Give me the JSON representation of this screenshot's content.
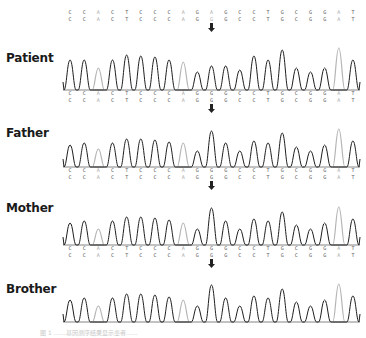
{
  "reference": {
    "row1": [
      "C",
      "C",
      "A",
      "C",
      "T",
      "C",
      "C",
      "C",
      "A",
      "G",
      "A",
      "G",
      "C",
      "C",
      "T",
      "G",
      "C",
      "G",
      "G",
      "A",
      "T"
    ],
    "row2": [
      "C",
      "C",
      "A",
      "C",
      "T",
      "C",
      "C",
      "C",
      "A",
      "G",
      "G",
      "G",
      "C",
      "C",
      "T",
      "G",
      "C",
      "G",
      "G",
      "A",
      "T"
    ],
    "grey_positions": [
      2,
      8,
      10,
      19
    ]
  },
  "mutation_arrow": {
    "icon": "down-arrow-icon",
    "position_index": 10
  },
  "panels": [
    {
      "label": "Patient",
      "heights": [
        30,
        30,
        22,
        30,
        35,
        34,
        33,
        30,
        28,
        18,
        24,
        24,
        20,
        34,
        30,
        40,
        22,
        18,
        22,
        42,
        30
      ],
      "grey_peaks": [
        2,
        8,
        19
      ],
      "seq_row1": [
        "C",
        "C",
        "A",
        "C",
        "T",
        "C",
        "C",
        "C",
        "A",
        "G",
        "G",
        "G",
        "C",
        "C",
        "T",
        "G",
        "C",
        "G",
        "G",
        "A",
        "T"
      ],
      "seq_row2": [
        "C",
        "C",
        "A",
        "C",
        "T",
        "C",
        "C",
        "C",
        "A",
        "G",
        "G",
        "G",
        "C",
        "C",
        "T",
        "G",
        "C",
        "G",
        "G",
        "A",
        "T"
      ]
    },
    {
      "label": "Father",
      "heights": [
        22,
        24,
        18,
        24,
        28,
        28,
        27,
        25,
        24,
        16,
        36,
        24,
        16,
        26,
        24,
        34,
        20,
        16,
        22,
        38,
        26
      ],
      "grey_peaks": [
        2,
        8,
        19
      ],
      "seq_row1": [
        "C",
        "C",
        "A",
        "C",
        "T",
        "C",
        "C",
        "C",
        "A",
        "G",
        "G",
        "G",
        "C",
        "C",
        "T",
        "G",
        "C",
        "G",
        "G",
        "A",
        "T"
      ],
      "seq_row2": [
        "C",
        "C",
        "A",
        "C",
        "T",
        "C",
        "C",
        "C",
        "A",
        "G",
        "G",
        "G",
        "C",
        "C",
        "T",
        "G",
        "C",
        "G",
        "G",
        "A",
        "T"
      ]
    },
    {
      "label": "Mother",
      "heights": [
        22,
        24,
        16,
        24,
        28,
        28,
        27,
        25,
        22,
        16,
        37,
        24,
        16,
        26,
        24,
        33,
        20,
        16,
        22,
        38,
        26
      ],
      "grey_peaks": [
        2,
        8,
        19
      ],
      "seq_row1": [
        "C",
        "C",
        "A",
        "C",
        "T",
        "C",
        "C",
        "C",
        "A",
        "G",
        "G",
        "G",
        "C",
        "C",
        "T",
        "G",
        "C",
        "G",
        "G",
        "A",
        "T"
      ],
      "seq_row2": [
        "C",
        "C",
        "A",
        "C",
        "T",
        "C",
        "C",
        "C",
        "A",
        "G",
        "G",
        "G",
        "C",
        "C",
        "T",
        "G",
        "C",
        "G",
        "G",
        "A",
        "T"
      ]
    },
    {
      "label": "Brother",
      "heights": [
        22,
        24,
        16,
        24,
        28,
        28,
        27,
        25,
        22,
        16,
        37,
        24,
        16,
        26,
        24,
        33,
        20,
        16,
        22,
        38,
        26
      ],
      "grey_peaks": [
        2,
        8,
        19
      ],
      "seq_row1": [],
      "seq_row2": []
    }
  ],
  "caption": "图 1 ……基因测序结果显示患者……"
}
